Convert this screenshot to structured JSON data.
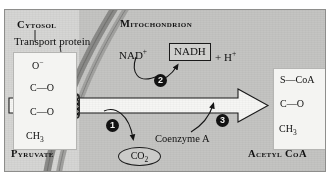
{
  "figure": {
    "compartments": {
      "cytosol_label": "Cytosol",
      "mitochondrion_label": "Mitochondrion"
    },
    "membrane": {
      "transport_protein_label": "Transport protein",
      "transport_protein_icon": "hatched-channel-icon"
    },
    "reactant": {
      "name": "Pyruvate",
      "structure": {
        "line1": "O−",
        "line2": "C=O",
        "line3": "C=O",
        "line4": "CH3"
      }
    },
    "product": {
      "name": "Acetyl CoA",
      "structure": {
        "line1": "S—CoA",
        "line2": "C=O",
        "line3": "CH3"
      }
    },
    "cofactors": {
      "nad_oxidized": "NAD+",
      "nad_reduced": "NADH",
      "proton": "+ H+",
      "coenzyme_a": "Coenzyme A"
    },
    "byproduct": {
      "label": "CO2",
      "shape": "oval"
    },
    "steps": [
      {
        "number": "1",
        "description": "Decarboxylation releasing CO2"
      },
      {
        "number": "2",
        "description": "Oxidation reducing NAD+ to NADH + H+"
      },
      {
        "number": "3",
        "description": "Coenzyme A attachment forming acetyl CoA"
      }
    ],
    "main_arrow": {
      "name": "reaction-arrow",
      "direction": "left-to-right"
    },
    "colors": {
      "background": "#c9c9c7",
      "cytosol": "#d6d6d4",
      "mitochondrion": "#c4c4c2",
      "membrane": "#9a9a98",
      "ink": "#111111",
      "structure_box": "#f4f4f2"
    }
  }
}
